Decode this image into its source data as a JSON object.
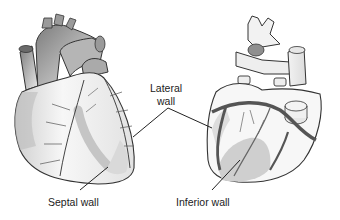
{
  "diagram": {
    "views": [
      {
        "name": "anterior-view"
      },
      {
        "name": "posterior-view"
      }
    ],
    "labels": {
      "lateral_line1": "Lateral",
      "lateral_line2": "wall",
      "septal": "Septal wall",
      "inferior": "Inferior wall"
    },
    "colors": {
      "outline": "#333333",
      "shading_dark": "#8a8a8a",
      "shading_light": "#d6d6d6",
      "highlight_region": "#c8c8c8",
      "vessels": "#555555"
    }
  }
}
